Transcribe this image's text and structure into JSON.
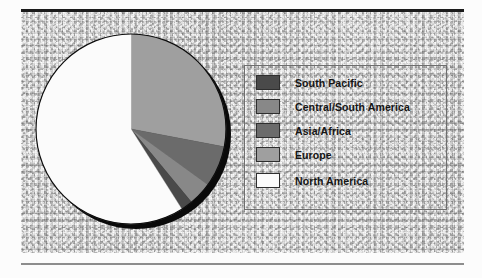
{
  "chart_data": {
    "type": "pie",
    "title": "",
    "subtitle": "",
    "xlabel": "",
    "ylabel": "",
    "grid": false,
    "legend_position": "right",
    "start_angle_deg": 0,
    "direction": "clockwise",
    "categories": [
      "Europe",
      "Asia/Africa",
      "Central/South America",
      "South Pacific",
      "North America"
    ],
    "values": [
      28.0,
      7.0,
      4.0,
      2.0,
      59.0
    ],
    "units": "percent",
    "slices": [
      {
        "label": "Europe",
        "value": 28.0,
        "color": "#9f9f9f",
        "start_deg": 0.0,
        "end_deg": 100.8
      },
      {
        "label": "Asia/Africa",
        "value": 7.0,
        "color": "#6b6b6b",
        "start_deg": 100.8,
        "end_deg": 126.0
      },
      {
        "label": "Central/South America",
        "value": 4.0,
        "color": "#888888",
        "start_deg": 126.0,
        "end_deg": 140.4
      },
      {
        "label": "South Pacific",
        "value": 2.0,
        "color": "#4a4a4a",
        "start_deg": 140.4,
        "end_deg": 147.6
      },
      {
        "label": "North America",
        "value": 59.0,
        "color": "#fbfbfb",
        "start_deg": 147.6,
        "end_deg": 360.0
      }
    ]
  },
  "figure": {
    "background_color": "#c9c9c9",
    "top_rule_color": "#1b1b1b",
    "bottom_rule_color": "#8d8d8d",
    "pie_outline_color": "#0d0d0d",
    "pie_shadow_color": "#0a0a0a"
  },
  "legend": {
    "border_color": "#6e6e6e",
    "items": [
      {
        "label": "South Pacific",
        "color": "#4a4a4a"
      },
      {
        "label": "Central/South America",
        "color": "#888888"
      },
      {
        "label": "Asia/Africa",
        "color": "#6b6b6b"
      },
      {
        "label": "Europe",
        "color": "#9f9f9f"
      },
      {
        "label": "North America",
        "color": "#fbfbfb"
      }
    ]
  }
}
